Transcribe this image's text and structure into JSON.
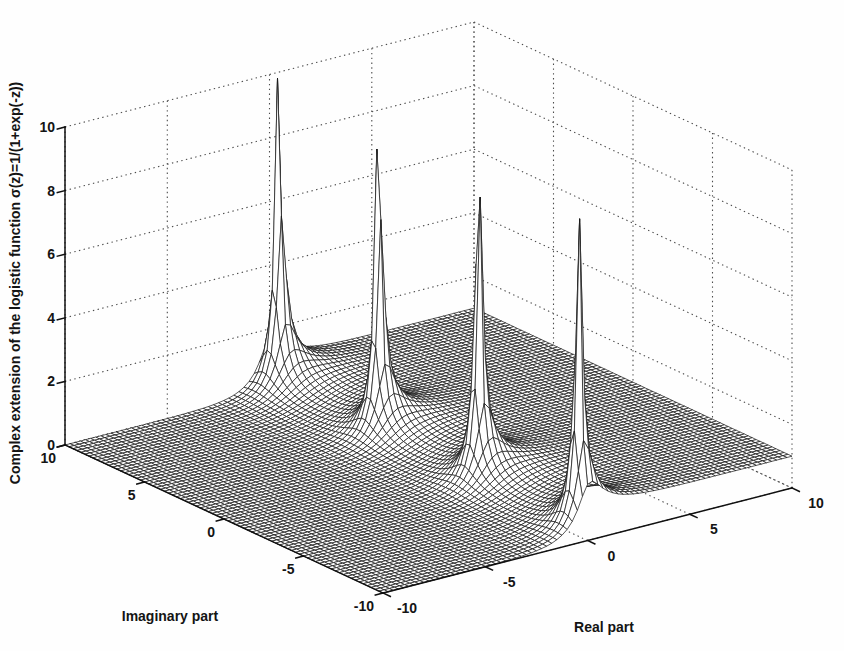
{
  "figure": {
    "background": "#fefefe",
    "ink_color": "#181818",
    "axis_color": "#101010",
    "grid_color": "#4c4c4c",
    "xlabel": "Real part",
    "ylabel": "Imaginary part",
    "zlabel": "Complex extension of the logistic function σ(z)=1/(1+exp(-z))"
  },
  "chart_data": {
    "type": "surface",
    "title": "",
    "function": "magnitude of logistic sigmoid on complex plane: |1/(1+exp(-z))|, z = x + iy",
    "xlabel": "Real part",
    "ylabel": "Imaginary part",
    "zlabel": "Complex extension of the logistic function σ(z)=1/(1+exp(-z))",
    "x_range": [
      -10,
      10
    ],
    "y_range": [
      -10,
      10
    ],
    "z_range": [
      0,
      10
    ],
    "x_ticks": [
      -10,
      -5,
      0,
      5,
      10
    ],
    "x_tick_labels": [
      "-10",
      "-5",
      "0",
      "5",
      "10"
    ],
    "y_ticks": [
      -10,
      -5,
      0,
      5,
      10
    ],
    "y_tick_labels": [
      "-10",
      "-5",
      "0",
      "5",
      "10"
    ],
    "z_ticks": [
      0,
      2,
      4,
      6,
      8,
      10
    ],
    "z_tick_labels": [
      "0",
      "2",
      "4",
      "6",
      "8",
      "10"
    ],
    "grid": true,
    "grid_style": "dotted",
    "mesh_step": 0.25,
    "z_clip": 10,
    "surface_style": "white-faced black wireframe mesh",
    "singularities_on_imaginary_axis": [
      -9.42477796,
      -3.14159265,
      3.14159265,
      9.42477796
    ],
    "plateau_values": {
      "real_part_negative": 0,
      "real_part_positive": 1
    }
  }
}
